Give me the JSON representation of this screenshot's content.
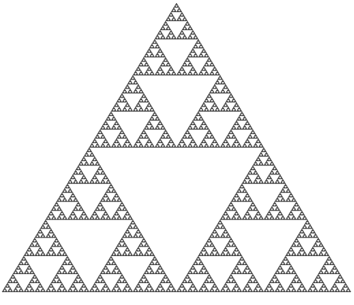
{
  "figure": {
    "name": "Sierpinski triangle",
    "width": 354,
    "height": 305,
    "background": "#ffffff",
    "fill_color": "#4a4a4a",
    "vertices": {
      "apex": [
        176.5,
        3
      ],
      "bottom_left": [
        2,
        292
      ],
      "bottom_right": [
        351,
        292
      ]
    },
    "depth": 7
  }
}
